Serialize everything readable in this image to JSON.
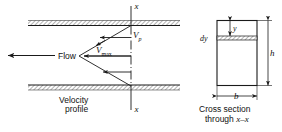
{
  "figure": {
    "type": "engineering-diagram",
    "background_color": "#ffffff",
    "line_color": "#1a1a1a",
    "wall_hatch_color": "#9a9a9a"
  },
  "left_view": {
    "flow_label": "Flow",
    "velocity_profile_label_line1": "Velocity",
    "velocity_profile_label_line2": "profile",
    "axis_label_top": "x",
    "axis_label_bottom": "x",
    "v_point_symbol": "V",
    "v_point_subscript": "p",
    "v_max_symbol": "V",
    "v_max_subscript": "max",
    "arrow_count": 4,
    "profile_shape": "triangular wedge, apex pointing left"
  },
  "cross_section": {
    "caption_line1": "Cross section",
    "caption_line2_prefix": "through ",
    "caption_line2_axis": "x–x",
    "height_label": "h",
    "width_label": "b",
    "strip_thickness_label": "dy",
    "depth_label": "y"
  }
}
